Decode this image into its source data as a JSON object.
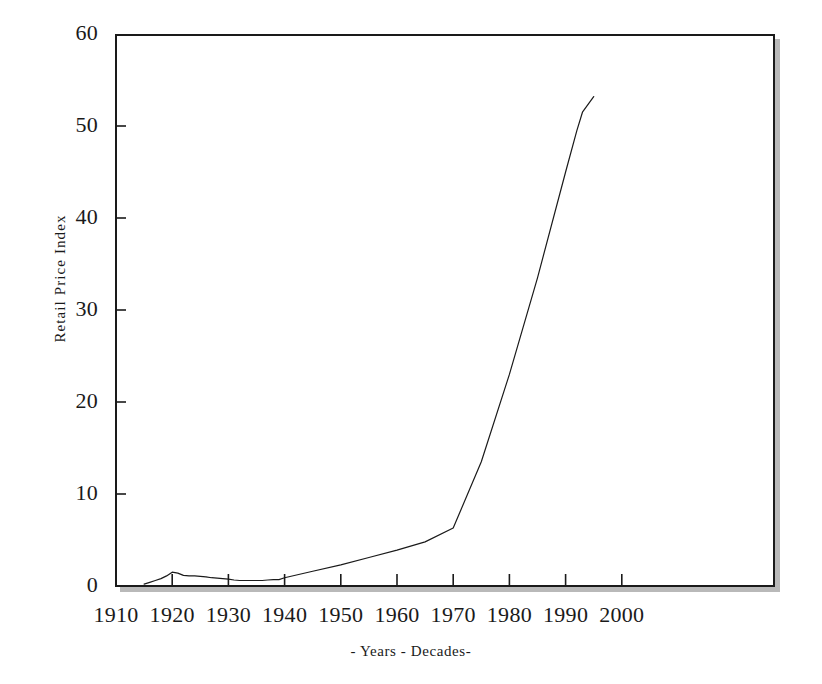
{
  "chart_data": {
    "type": "line",
    "title": "",
    "subtitle": "",
    "xlabel": "- Years - Decades-",
    "ylabel": "Retail Price Index",
    "xlim": [
      1910,
      2000
    ],
    "ylim": [
      0,
      60
    ],
    "xticks": [
      1910,
      1920,
      1930,
      1940,
      1950,
      1960,
      1970,
      1980,
      1990,
      2000
    ],
    "yticks": [
      0,
      10,
      20,
      30,
      40,
      50,
      60
    ],
    "xtick_labels": [
      "1910",
      "1920",
      "1930",
      "1940",
      "1950",
      "1960",
      "1970",
      "1980",
      "1990",
      "2000"
    ],
    "ytick_labels": [
      "0",
      "10",
      "20",
      "30",
      "40",
      "50",
      "60"
    ],
    "grid": false,
    "legend": false,
    "legend_position": "none",
    "line_color": "#1a1a1a",
    "line_width": 1.2,
    "frame_color": "#1a1a1a",
    "frame_shadow_color": "#b9b9b9",
    "background_color": "#ffffff",
    "series": [
      {
        "name": "Retail Price Index",
        "x": [
          1915,
          1916,
          1917,
          1918,
          1919,
          1920,
          1921,
          1922,
          1923,
          1924,
          1925,
          1926,
          1927,
          1928,
          1929,
          1930,
          1931,
          1932,
          1933,
          1934,
          1935,
          1936,
          1937,
          1938,
          1939,
          1940,
          1945,
          1950,
          1955,
          1960,
          1965,
          1970,
          1975,
          1980,
          1985,
          1990,
          1992,
          1993,
          1995
        ],
        "values": [
          0.2,
          0.4,
          0.6,
          0.8,
          1.1,
          1.5,
          1.4,
          1.15,
          1.1,
          1.1,
          1.05,
          1.0,
          0.9,
          0.85,
          0.8,
          0.75,
          0.65,
          0.6,
          0.6,
          0.6,
          0.6,
          0.6,
          0.65,
          0.7,
          0.7,
          0.9,
          1.6,
          2.3,
          3.1,
          3.9,
          4.8,
          6.3,
          13.5,
          23.0,
          33.5,
          45.0,
          49.5,
          51.5,
          53.2
        ]
      }
    ]
  },
  "axes": {
    "y_title": "Retail Price Index",
    "x_title": "- Years - Decades-"
  }
}
